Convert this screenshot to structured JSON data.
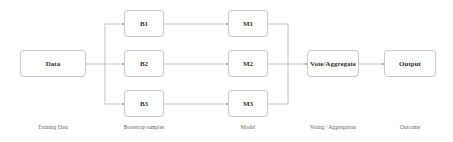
{
  "diagram": {
    "nodes": {
      "data": "Data",
      "b1": "B1",
      "b2": "B2",
      "b3": "B3",
      "m1": "M1",
      "m2": "M2",
      "m3": "M3",
      "vote": "Vote/Aggregate",
      "output": "Output"
    },
    "captions": {
      "training": "Training Data",
      "bootstrap": "Bootstrap samples",
      "model": "Model",
      "voting": "Voting / Aggregation",
      "outcome": "Outcome"
    },
    "colors": {
      "line": "#9a9a9a",
      "border": "#c8c8c8",
      "text": "#333333"
    }
  }
}
